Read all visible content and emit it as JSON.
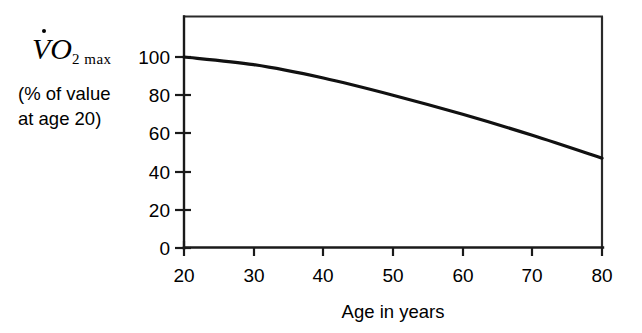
{
  "chart_data": {
    "type": "line",
    "title": "",
    "xlabel": "Age in years",
    "ylabel": "VO2max (% of value at age 20)",
    "ylabel_symbol_v": "V",
    "ylabel_symbol_o": "O",
    "ylabel_symbol_sub": "2 max",
    "ylabel_units_line1": "(% of value",
    "ylabel_units_line2": "at age 20)",
    "x": [
      20,
      30,
      40,
      50,
      60,
      70,
      80
    ],
    "values": [
      100,
      96,
      89,
      80,
      70,
      59,
      47
    ],
    "series": [
      {
        "name": "VO2max decline with age",
        "values": [
          100,
          96,
          89,
          80,
          70,
          59,
          47
        ]
      }
    ],
    "xlim": [
      20,
      80
    ],
    "ylim": [
      0,
      110
    ],
    "xticks": [
      20,
      30,
      40,
      50,
      60,
      70,
      80
    ],
    "yticks": [
      0,
      20,
      40,
      60,
      80,
      100
    ],
    "xticklabels": [
      "20",
      "30",
      "40",
      "50",
      "60",
      "70",
      "80"
    ],
    "yticklabels": [
      "0",
      "20",
      "40",
      "60",
      "80",
      "100"
    ],
    "grid": false,
    "legend": false,
    "legend_position": "none",
    "line_color": "#111111",
    "axis_color": "#1a1a1a",
    "background_color": "#ffffff"
  },
  "axis": {
    "x_title": "Age in years",
    "y_tick_0": "0",
    "y_tick_20": "20",
    "y_tick_40": "40",
    "y_tick_60": "60",
    "y_tick_80": "80",
    "y_tick_100": "100",
    "x_tick_20": "20",
    "x_tick_30": "30",
    "x_tick_40": "40",
    "x_tick_50": "50",
    "x_tick_60": "60",
    "x_tick_70": "70",
    "x_tick_80": "80"
  }
}
